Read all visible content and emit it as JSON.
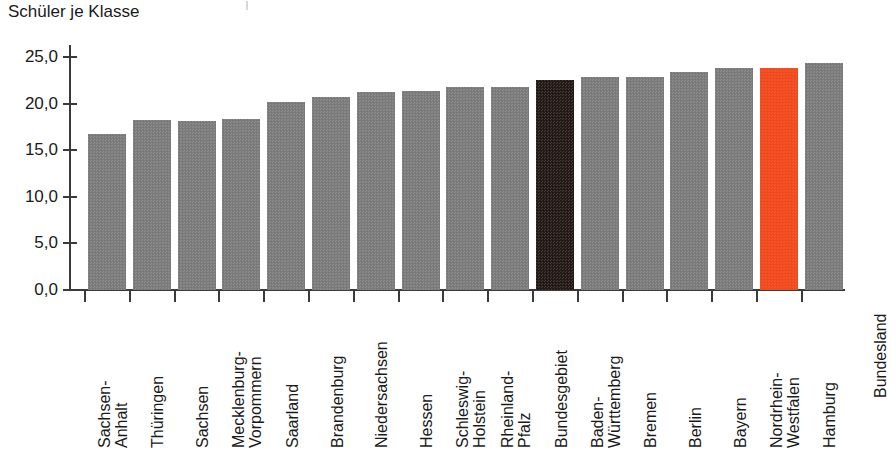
{
  "chart_data": {
    "type": "bar",
    "title": "Schüler je Klasse",
    "xlabel": "Bundesland",
    "ylabel": "",
    "ylim": [
      0,
      25
    ],
    "grid": false,
    "legend": "none",
    "ytick_labels": [
      "0,0",
      "5,0",
      "10,0",
      "15,0",
      "20,0",
      "25,0"
    ],
    "ytick_values": [
      0,
      5,
      10,
      15,
      20,
      25
    ],
    "categories": [
      "Sachsen-\nAnhalt",
      "Thüringen",
      "Sachsen",
      "Mecklenburg-\nVorpommern",
      "Saarland",
      "Brandenburg",
      "Niedersachsen",
      "Hessen",
      "Schleswig-\nHolstein",
      "Rheinland-\nPfalz",
      "Bundesgebiet",
      "Baden-\nWürttemberg",
      "Bremen",
      "Berlin",
      "Bayern",
      "Nordrhein-\nWestfalen",
      "Hamburg"
    ],
    "values": [
      16.7,
      18.2,
      18.1,
      18.3,
      20.2,
      20.7,
      21.2,
      21.3,
      21.8,
      21.8,
      22.5,
      22.9,
      22.9,
      23.4,
      23.8,
      23.8,
      24.4
    ],
    "bar_styles": [
      "normal",
      "normal",
      "normal",
      "normal",
      "normal",
      "normal",
      "normal",
      "normal",
      "normal",
      "normal",
      "total",
      "normal",
      "normal",
      "normal",
      "normal",
      "highlight",
      "normal"
    ],
    "colors": {
      "bar": "#7e7e7e",
      "total": "#241b18",
      "highlight": "#f44b1e",
      "axis": "#3a3a3a",
      "text": "#1a1a1a",
      "background": "#ffffff"
    }
  }
}
